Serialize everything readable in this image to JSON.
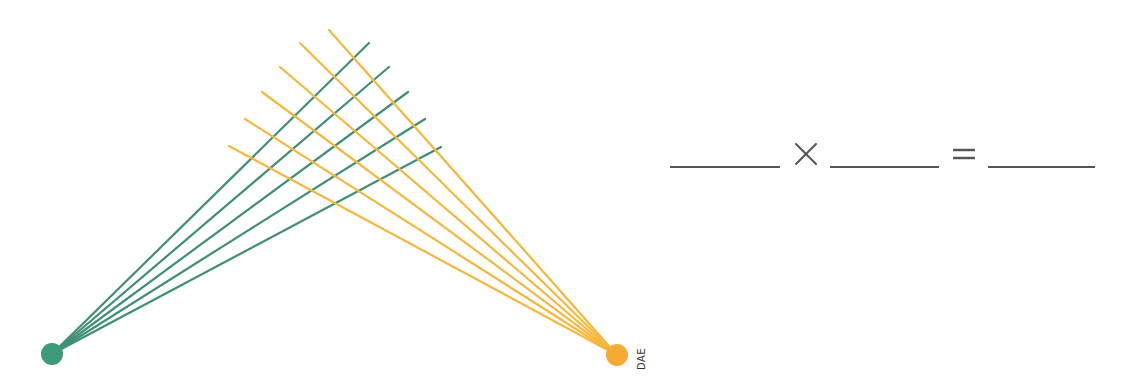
{
  "diagram": {
    "colors": {
      "green": "#3a9a7a",
      "green_line": "#3f8f77",
      "orange": "#f7aa33",
      "orange_line": "#f5b83d",
      "ink": "#555555"
    },
    "left_node": {
      "cx": 52,
      "cy": 354,
      "r": 11,
      "color": "#3a9a7a",
      "label": ""
    },
    "right_node": {
      "cx": 617,
      "cy": 355,
      "r": 11,
      "color": "#f7aa33",
      "label": "DAE"
    },
    "green_lines": [
      {
        "x2": 369,
        "y2": 43
      },
      {
        "x2": 389,
        "y2": 67
      },
      {
        "x2": 408,
        "y2": 92
      },
      {
        "x2": 425,
        "y2": 119
      },
      {
        "x2": 441,
        "y2": 147
      }
    ],
    "orange_lines": [
      {
        "x2": 329,
        "y2": 30
      },
      {
        "x2": 300,
        "y2": 43
      },
      {
        "x2": 280,
        "y2": 67
      },
      {
        "x2": 262,
        "y2": 92
      },
      {
        "x2": 245,
        "y2": 119
      },
      {
        "x2": 229,
        "y2": 146
      }
    ],
    "green_count": 5,
    "orange_count": 6
  },
  "equation": {
    "times_symbol": "×",
    "equals_symbol": "=",
    "blanks": [
      {
        "x1": 670,
        "x2": 780,
        "value": ""
      },
      {
        "x1": 830,
        "x2": 939,
        "value": ""
      },
      {
        "x1": 988,
        "x2": 1095,
        "value": ""
      }
    ]
  }
}
